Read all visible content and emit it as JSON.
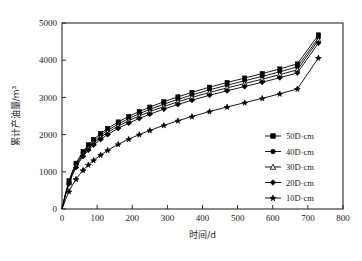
{
  "chart_data": {
    "type": "line",
    "title": "",
    "xlabel": "时间/d",
    "ylabel": "累计产油量/m³",
    "xlim": [
      0,
      800
    ],
    "ylim": [
      0,
      5000
    ],
    "xticks": [
      0,
      100,
      200,
      300,
      400,
      500,
      600,
      700,
      800
    ],
    "yticks": [
      0,
      1000,
      2000,
      3000,
      4000,
      5000
    ],
    "grid": false,
    "legend_position": "right-middle",
    "x": [
      0,
      10,
      20,
      30,
      40,
      50,
      60,
      75,
      90,
      110,
      130,
      160,
      190,
      220,
      250,
      290,
      330,
      370,
      420,
      470,
      520,
      570,
      620,
      670,
      730
    ],
    "series": [
      {
        "name": "50D·cm",
        "marker": "square-filled",
        "values": [
          0,
          420,
          760,
          1020,
          1230,
          1400,
          1545,
          1725,
          1870,
          2030,
          2165,
          2340,
          2490,
          2620,
          2740,
          2885,
          3015,
          3135,
          3275,
          3400,
          3520,
          3640,
          3765,
          3900,
          4680
        ]
      },
      {
        "name": "40D·cm",
        "marker": "circle-filled",
        "values": [
          0,
          405,
          735,
          990,
          1195,
          1360,
          1500,
          1678,
          1820,
          1978,
          2112,
          2285,
          2432,
          2560,
          2678,
          2820,
          2948,
          3066,
          3204,
          3328,
          3446,
          3565,
          3688,
          3820,
          4600
        ]
      },
      {
        "name": "30D·cm",
        "marker": "triangle-open",
        "values": [
          0,
          390,
          710,
          958,
          1158,
          1320,
          1458,
          1632,
          1772,
          1928,
          2060,
          2230,
          2375,
          2500,
          2616,
          2756,
          2882,
          2998,
          3134,
          3256,
          3372,
          3490,
          3612,
          3742,
          4540
        ]
      },
      {
        "name": "20D·cm",
        "marker": "diamond-filled",
        "values": [
          0,
          372,
          682,
          922,
          1118,
          1276,
          1412,
          1582,
          1720,
          1872,
          2002,
          2168,
          2310,
          2434,
          2548,
          2686,
          2810,
          2924,
          3058,
          3178,
          3292,
          3408,
          3528,
          3658,
          4460
        ]
      },
      {
        "name": "10D·cm",
        "marker": "star-filled",
        "values": [
          0,
          250,
          470,
          650,
          800,
          930,
          1042,
          1188,
          1310,
          1452,
          1578,
          1740,
          1878,
          2000,
          2112,
          2248,
          2372,
          2486,
          2620,
          2742,
          2858,
          2974,
          3096,
          3228,
          4060
        ]
      }
    ]
  },
  "legend": {
    "items": [
      {
        "label": "50D·cm"
      },
      {
        "label": "40D·cm"
      },
      {
        "label": "30D·cm"
      },
      {
        "label": "20D·cm"
      },
      {
        "label": "10D·cm"
      }
    ]
  },
  "axes": {
    "x_title": "时间/d",
    "y_title": "累计产油量/m³",
    "x_tick_labels": [
      "0",
      "100",
      "200",
      "300",
      "400",
      "500",
      "600",
      "700",
      "800"
    ],
    "y_tick_labels": [
      "0",
      "1000",
      "2000",
      "3000",
      "4000",
      "5000"
    ]
  },
  "colors": {
    "line": "#000000",
    "axis": "#2a2a2a",
    "background": "#ffffff"
  }
}
